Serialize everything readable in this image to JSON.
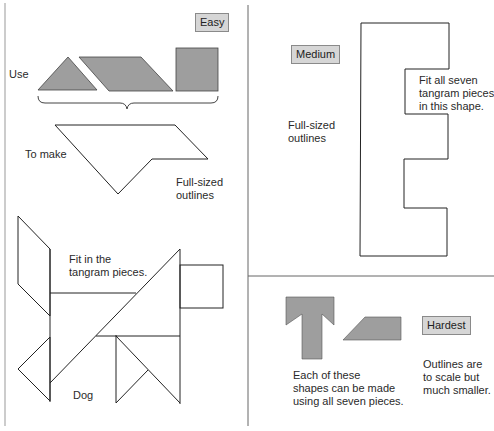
{
  "panels": {
    "easy": {
      "badge": "Easy",
      "use_label": "Use",
      "make_label": "To make",
      "note": "Full-sized\noutlines"
    },
    "dog": {
      "instruction": "Fit in the\ntangram pieces.",
      "caption": "Dog"
    },
    "medium": {
      "badge": "Medium",
      "note": "Full-sized\noutlines",
      "instruction": "Fit all seven\ntangram pieces\nin this shape."
    },
    "hardest": {
      "badge": "Hardest",
      "caption": "Each of these\nshapes can be made\nusing all seven pieces.",
      "note": "Outlines are\nto scale but\nmuch smaller."
    }
  },
  "colors": {
    "piece_fill": "#9e9e9e",
    "badge_fill": "#d6d6d6",
    "outline": "#222222",
    "divider": "#666666"
  }
}
